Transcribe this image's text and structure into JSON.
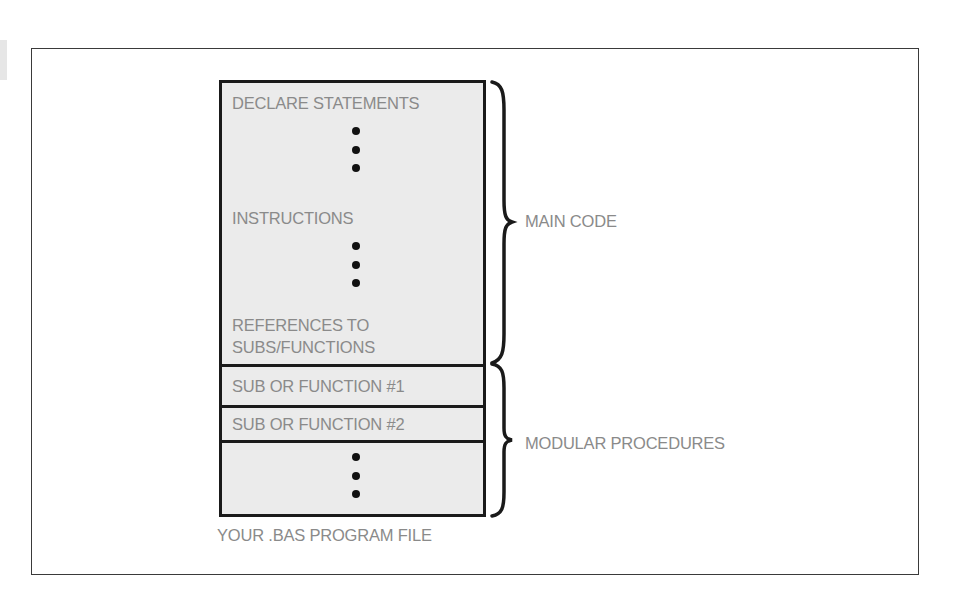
{
  "diagram": {
    "file_box": {
      "caption": "YOUR .BAS PROGRAM FILE",
      "main_section": {
        "declare": "DECLARE STATEMENTS",
        "instructions": "INSTRUCTIONS",
        "references_line1": "REFERENCES TO",
        "references_line2": "SUBS/FUNCTIONS"
      },
      "procedures": [
        {
          "label": "SUB OR FUNCTION #1"
        },
        {
          "label": "SUB OR FUNCTION #2"
        },
        {
          "label": ""
        }
      ],
      "ellipsis_icon": "vertical-ellipsis"
    },
    "braces": [
      {
        "label": "MAIN CODE",
        "spans": "main_section"
      },
      {
        "label": "MODULAR PROCEDURES",
        "spans": "procedures"
      }
    ],
    "colors": {
      "text": "#8a8a8a",
      "box_fill": "#ebebeb",
      "outline": "#1a1a1a",
      "frame": "#3a3a3a"
    }
  }
}
